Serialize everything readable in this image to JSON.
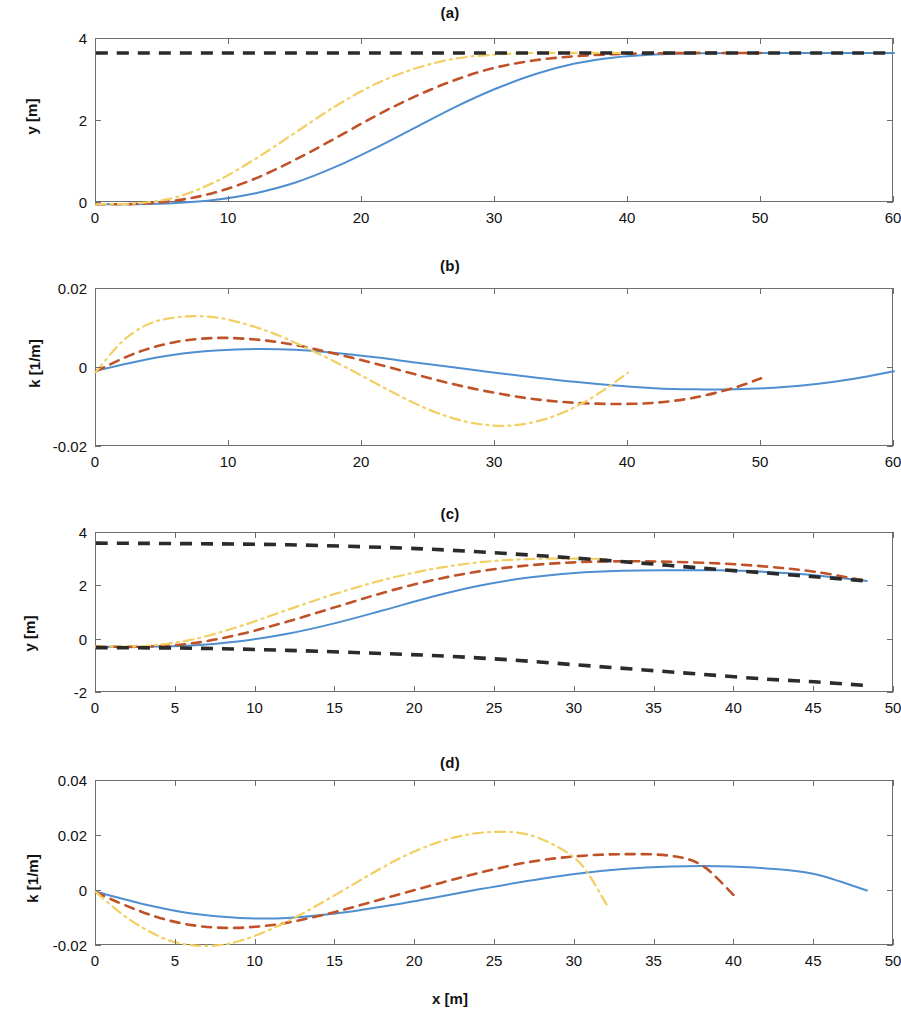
{
  "figure": {
    "background": "#ffffff",
    "xlabel": "x [m]",
    "colors": {
      "series1": "#4f8fd0",
      "series2": "#c0522a",
      "series3": "#f2cf63",
      "bounds": "#2b2b2b",
      "axis": "#6e6e6e"
    }
  },
  "panels": [
    {
      "key": "a",
      "title": "(a)",
      "ylabel": "y [m]",
      "xlabel": "",
      "xlim": [
        0,
        60
      ],
      "ylim": [
        0,
        4
      ],
      "xticks": [
        0,
        10,
        20,
        30,
        40,
        50,
        60
      ],
      "xticklabels": [
        "0",
        "10",
        "20",
        "30",
        "40",
        "50",
        "60"
      ],
      "yticks": [
        0,
        2,
        4
      ],
      "yticklabels": [
        "0",
        "2",
        "4"
      ],
      "grid": false
    },
    {
      "key": "b",
      "title": "(b)",
      "ylabel": "k [1/m]",
      "xlabel": "",
      "xlim": [
        0,
        60
      ],
      "ylim": [
        -0.02,
        0.02
      ],
      "xticks": [
        0,
        10,
        20,
        30,
        40,
        50,
        60
      ],
      "xticklabels": [
        "0",
        "10",
        "20",
        "30",
        "40",
        "50",
        "60"
      ],
      "yticks": [
        -0.02,
        0,
        0.02
      ],
      "yticklabels": [
        "-0.02",
        "0",
        "0.02"
      ],
      "grid": false
    },
    {
      "key": "c",
      "title": "(c)",
      "ylabel": "y [m]",
      "xlabel": "",
      "xlim": [
        0,
        50
      ],
      "ylim": [
        -2,
        4
      ],
      "xticks": [
        0,
        5,
        10,
        15,
        20,
        25,
        30,
        35,
        40,
        45,
        50
      ],
      "xticklabels": [
        "0",
        "5",
        "10",
        "15",
        "20",
        "25",
        "30",
        "35",
        "40",
        "45",
        "50"
      ],
      "yticks": [
        -2,
        0,
        2,
        4
      ],
      "yticklabels": [
        "-2",
        "0",
        "2",
        "4"
      ],
      "grid": false
    },
    {
      "key": "d",
      "title": "(d)",
      "ylabel": "k [1/m]",
      "xlabel": "x [m]",
      "xlim": [
        0,
        50
      ],
      "ylim": [
        -0.02,
        0.04
      ],
      "xticks": [
        0,
        5,
        10,
        15,
        20,
        25,
        30,
        35,
        40,
        45,
        50
      ],
      "xticklabels": [
        "0",
        "5",
        "10",
        "15",
        "20",
        "25",
        "30",
        "35",
        "40",
        "45",
        "50"
      ],
      "yticks": [
        -0.02,
        0,
        0.02,
        0.04
      ],
      "yticklabels": [
        "-0.02",
        "0",
        "0.02",
        "0.04"
      ],
      "grid": false
    }
  ],
  "chart_data": [
    {
      "type": "line",
      "panel": "a",
      "title": "(a)",
      "xlabel": "",
      "ylabel": "y [m]",
      "xlim": [
        0,
        60
      ],
      "ylim": [
        0,
        4
      ],
      "grid": false,
      "legend": "none",
      "series": [
        {
          "name": "trajectory-slow",
          "style": "solid",
          "color": "#4f8fd0",
          "x": [
            0,
            3,
            6,
            9,
            12,
            15,
            18,
            21,
            24,
            27,
            30,
            33,
            36,
            39,
            42,
            45,
            48,
            51,
            54,
            57,
            60
          ],
          "y": [
            -0.03,
            -0.03,
            0.0,
            0.08,
            0.24,
            0.5,
            0.88,
            1.34,
            1.84,
            2.34,
            2.78,
            3.14,
            3.4,
            3.55,
            3.62,
            3.65,
            3.66,
            3.66,
            3.66,
            3.66,
            3.66
          ]
        },
        {
          "name": "trajectory-medium",
          "style": "dashed",
          "color": "#c0522a",
          "x": [
            0,
            3,
            6,
            9,
            12,
            15,
            18,
            21,
            24,
            27,
            30,
            33,
            36,
            39,
            42,
            45,
            48,
            50
          ],
          "y": [
            -0.03,
            -0.02,
            0.06,
            0.26,
            0.6,
            1.06,
            1.58,
            2.12,
            2.6,
            3.0,
            3.3,
            3.48,
            3.58,
            3.63,
            3.65,
            3.66,
            3.66,
            3.66
          ]
        },
        {
          "name": "trajectory-fast",
          "style": "dashdot",
          "color": "#f2cf63",
          "x": [
            0,
            3,
            6,
            9,
            12,
            15,
            18,
            21,
            24,
            27,
            30,
            33,
            36,
            38,
            40
          ],
          "y": [
            -0.03,
            -0.01,
            0.14,
            0.52,
            1.08,
            1.72,
            2.36,
            2.9,
            3.28,
            3.52,
            3.62,
            3.66,
            3.66,
            3.66,
            3.66
          ]
        },
        {
          "name": "target-lane-bound",
          "style": "bound-dashed",
          "color": "#2b2b2b",
          "x": [
            0,
            60
          ],
          "y": [
            3.66,
            3.66
          ]
        }
      ]
    },
    {
      "type": "line",
      "panel": "b",
      "title": "(b)",
      "xlabel": "",
      "ylabel": "k [1/m]",
      "xlim": [
        0,
        60
      ],
      "ylim": [
        -0.02,
        0.02
      ],
      "grid": false,
      "legend": "none",
      "series": [
        {
          "name": "curvature-slow",
          "style": "solid",
          "color": "#4f8fd0",
          "x": [
            0,
            3,
            6,
            9,
            12,
            15,
            18,
            21,
            24,
            27,
            30,
            33,
            36,
            39,
            42,
            45,
            48,
            51,
            54,
            57,
            60
          ],
          "y": [
            -0.0007,
            0.0016,
            0.0034,
            0.0044,
            0.0048,
            0.0046,
            0.0038,
            0.0027,
            0.0014,
            0.0001,
            -0.0012,
            -0.0024,
            -0.0035,
            -0.0044,
            -0.0051,
            -0.0054,
            -0.0054,
            -0.005,
            -0.0041,
            -0.0027,
            -0.0008
          ]
        },
        {
          "name": "curvature-medium",
          "style": "dashed",
          "color": "#c0522a",
          "x": [
            0,
            3,
            6,
            9,
            12,
            15,
            18,
            21,
            24,
            27,
            30,
            33,
            36,
            39,
            42,
            45,
            48,
            50
          ],
          "y": [
            -0.0008,
            0.0038,
            0.0066,
            0.0076,
            0.0072,
            0.0058,
            0.0036,
            0.0011,
            -0.0016,
            -0.0042,
            -0.0063,
            -0.0079,
            -0.0088,
            -0.0091,
            -0.0088,
            -0.0075,
            -0.005,
            -0.0026
          ]
        },
        {
          "name": "curvature-fast",
          "style": "dashdot",
          "color": "#f2cf63",
          "x": [
            0,
            2,
            4,
            6,
            8,
            10,
            13,
            16,
            19,
            22,
            25,
            28,
            31,
            34,
            37,
            40
          ],
          "y": [
            -0.001,
            0.0068,
            0.0112,
            0.0128,
            0.0131,
            0.0122,
            0.0092,
            0.0048,
            -0.0002,
            -0.0056,
            -0.0105,
            -0.0137,
            -0.0146,
            -0.0127,
            -0.0081,
            -0.0012
          ]
        }
      ]
    },
    {
      "type": "line",
      "panel": "c",
      "title": "(c)",
      "xlabel": "",
      "ylabel": "y [m]",
      "xlim": [
        0,
        50
      ],
      "ylim": [
        -2,
        4
      ],
      "grid": false,
      "legend": "none",
      "series": [
        {
          "name": "trajectory-slow",
          "style": "solid",
          "color": "#4f8fd0",
          "x": [
            0,
            3,
            6,
            9,
            12,
            15,
            18,
            21,
            24,
            27,
            30,
            33,
            36,
            39,
            42,
            45,
            48.3
          ],
          "y": [
            -0.26,
            -0.27,
            -0.22,
            -0.06,
            0.22,
            0.62,
            1.1,
            1.6,
            2.02,
            2.32,
            2.5,
            2.58,
            2.6,
            2.6,
            2.54,
            2.42,
            2.2
          ]
        },
        {
          "name": "trajectory-medium",
          "style": "dashed",
          "color": "#c0522a",
          "x": [
            0,
            3,
            6,
            9,
            12,
            15,
            18,
            21,
            24,
            27,
            30,
            33,
            36,
            39,
            42,
            45,
            48.3
          ],
          "y": [
            -0.26,
            -0.26,
            -0.14,
            0.2,
            0.68,
            1.22,
            1.76,
            2.22,
            2.56,
            2.78,
            2.9,
            2.94,
            2.92,
            2.86,
            2.74,
            2.55,
            2.2
          ]
        },
        {
          "name": "trajectory-fast",
          "style": "dashdot",
          "color": "#f2cf63",
          "x": [
            0,
            3,
            6,
            9,
            12,
            15,
            18,
            21,
            24,
            27,
            30,
            32
          ],
          "y": [
            -0.26,
            -0.24,
            0.0,
            0.5,
            1.12,
            1.72,
            2.24,
            2.64,
            2.9,
            3.02,
            3.04,
            3.02
          ]
        },
        {
          "name": "upper-bound",
          "style": "bound-dashed",
          "color": "#2b2b2b",
          "x": [
            0,
            6,
            12,
            18,
            22,
            26,
            30,
            34,
            38,
            42,
            45,
            48.3
          ],
          "y": [
            3.62,
            3.6,
            3.56,
            3.46,
            3.36,
            3.22,
            3.06,
            2.88,
            2.68,
            2.5,
            2.36,
            2.2
          ]
        },
        {
          "name": "lower-bound",
          "style": "bound-dashed",
          "color": "#2b2b2b",
          "x": [
            0,
            6,
            12,
            18,
            22,
            26,
            30,
            34,
            38,
            42,
            45,
            48.3
          ],
          "y": [
            -0.3,
            -0.32,
            -0.4,
            -0.52,
            -0.62,
            -0.76,
            -0.94,
            -1.12,
            -1.3,
            -1.48,
            -1.58,
            -1.72
          ]
        }
      ]
    },
    {
      "type": "line",
      "panel": "d",
      "title": "(d)",
      "xlabel": "x [m]",
      "ylabel": "k [1/m]",
      "xlim": [
        0,
        50
      ],
      "ylim": [
        -0.02,
        0.04
      ],
      "grid": false,
      "legend": "none",
      "series": [
        {
          "name": "curvature-slow",
          "style": "solid",
          "color": "#4f8fd0",
          "x": [
            0,
            3,
            6,
            9,
            12,
            15,
            18,
            21,
            24,
            27,
            30,
            33,
            36,
            39,
            42,
            45,
            48.3
          ],
          "y": [
            -0.0003,
            -0.0048,
            -0.0082,
            -0.0098,
            -0.0098,
            -0.0082,
            -0.0056,
            -0.0026,
            0.0006,
            0.0036,
            0.0062,
            0.008,
            0.0089,
            0.009,
            0.0082,
            0.0062,
            0.0002
          ]
        },
        {
          "name": "curvature-medium",
          "style": "dashed",
          "color": "#c0522a",
          "x": [
            0,
            2,
            4,
            6,
            8,
            10,
            12,
            15,
            18,
            21,
            24,
            27,
            30,
            33,
            36,
            38,
            40
          ],
          "y": [
            -0.0005,
            -0.0056,
            -0.0098,
            -0.0124,
            -0.0134,
            -0.013,
            -0.0115,
            -0.0076,
            -0.0028,
            0.002,
            0.0066,
            0.0104,
            0.0126,
            0.0134,
            0.0128,
            0.0092,
            -0.0018
          ]
        },
        {
          "name": "curvature-fast",
          "style": "dashdot",
          "color": "#f2cf63",
          "x": [
            0,
            1.5,
            3,
            4.5,
            6,
            7.5,
            9,
            11,
            13,
            15,
            17,
            19,
            21,
            23,
            25,
            27,
            29,
            30.5,
            32
          ],
          "y": [
            -0.0004,
            -0.0078,
            -0.0136,
            -0.0178,
            -0.0197,
            -0.0198,
            -0.0182,
            -0.0138,
            -0.008,
            -0.0014,
            0.0054,
            0.0118,
            0.0168,
            0.0202,
            0.0215,
            0.0206,
            0.0158,
            0.009,
            -0.005
          ]
        }
      ]
    }
  ]
}
